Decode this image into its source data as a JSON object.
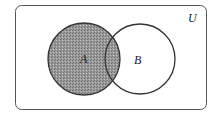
{
  "diagram": {
    "type": "venn",
    "universe_label": "U",
    "sets": [
      {
        "label": "A",
        "shaded": true
      },
      {
        "label": "B",
        "shaded": false
      }
    ],
    "shaded_region": "A",
    "colors": {
      "outline": "#333333",
      "shade": "#8a8a8a",
      "background": "#ffffff"
    }
  }
}
